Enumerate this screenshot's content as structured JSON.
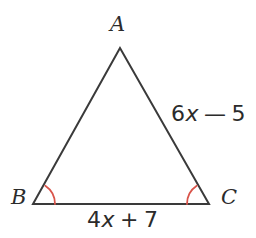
{
  "figure": {
    "background_color": "#ffffff",
    "stroke_color": "#3a3a3a",
    "arc_color": "#d9544a",
    "text_color": "#2b2b2b"
  },
  "geometry": {
    "shape": "triangle",
    "vertices": [
      {
        "name": "A",
        "x": 120,
        "y": 48
      },
      {
        "name": "B",
        "x": 33,
        "y": 204
      },
      {
        "name": "C",
        "x": 209,
        "y": 204
      }
    ],
    "polygon_points": "120,48 33,204 209,204",
    "sides": [
      {
        "from": "A",
        "to": "B",
        "label": ""
      },
      {
        "from": "A",
        "to": "C",
        "label": "6x − 5"
      },
      {
        "from": "B",
        "to": "C",
        "label": "4x + 7"
      }
    ],
    "angle_marks": [
      {
        "at": "B",
        "style": "single-arc",
        "color": "#d9544a"
      },
      {
        "at": "C",
        "style": "single-arc",
        "color": "#d9544a"
      }
    ]
  },
  "labels": {
    "vertex_a": "A",
    "vertex_b": "B",
    "vertex_c": "C",
    "side_ac": {
      "coefficient": "6",
      "variable": "x",
      "operator": "—",
      "constant": "5",
      "full": "6x − 5"
    },
    "side_bc": {
      "coefficient": "4",
      "variable": "x",
      "operator": "+",
      "constant": "7",
      "full": "4x + 7"
    }
  }
}
